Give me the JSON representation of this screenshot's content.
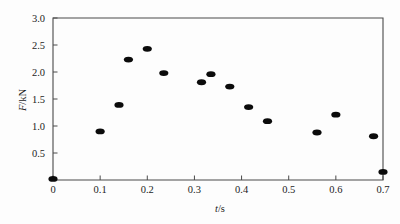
{
  "chart_data": {
    "type": "scatter",
    "title": "",
    "xlabel": "t/s",
    "ylabel": "F/kN",
    "xlabel_symbol": "t",
    "xlabel_unit": "/s",
    "ylabel_symbol": "F",
    "ylabel_unit": "/kN",
    "xlim": [
      0,
      0.7
    ],
    "ylim": [
      0,
      3.0
    ],
    "xticks": [
      0,
      0.1,
      0.2,
      0.3,
      0.4,
      0.5,
      0.6,
      0.7
    ],
    "xticklabels": [
      "0",
      "0.1",
      "0.2",
      "0.3",
      "0.4",
      "0.5",
      "0.6",
      "0.7"
    ],
    "yticks": [
      0.5,
      1.0,
      1.5,
      2.0,
      2.5,
      3.0
    ],
    "yticklabels": [
      "0.5",
      "1.0",
      "1.5",
      "2.0",
      "2.5",
      "3.0"
    ],
    "grid": false,
    "legend": null,
    "marker": "filled-ellipse",
    "marker_color": "#0b0b0b",
    "frame_color": "#4a4a4a",
    "background": "#fdfdfd",
    "x": [
      0.0,
      0.1,
      0.14,
      0.16,
      0.2,
      0.235,
      0.315,
      0.335,
      0.375,
      0.415,
      0.455,
      0.56,
      0.6,
      0.68,
      0.7
    ],
    "y": [
      0.02,
      0.9,
      1.39,
      2.23,
      2.43,
      1.98,
      1.81,
      1.96,
      1.73,
      1.35,
      1.09,
      0.88,
      1.21,
      0.81,
      0.15
    ],
    "points": [
      {
        "t": 0.0,
        "F": 0.02
      },
      {
        "t": 0.1,
        "F": 0.9
      },
      {
        "t": 0.14,
        "F": 1.39
      },
      {
        "t": 0.16,
        "F": 2.23
      },
      {
        "t": 0.2,
        "F": 2.43
      },
      {
        "t": 0.235,
        "F": 1.98
      },
      {
        "t": 0.315,
        "F": 1.81
      },
      {
        "t": 0.335,
        "F": 1.96
      },
      {
        "t": 0.375,
        "F": 1.73
      },
      {
        "t": 0.415,
        "F": 1.35
      },
      {
        "t": 0.455,
        "F": 1.09
      },
      {
        "t": 0.56,
        "F": 0.88
      },
      {
        "t": 0.6,
        "F": 1.21
      },
      {
        "t": 0.68,
        "F": 0.81
      },
      {
        "t": 0.7,
        "F": 0.15
      }
    ]
  }
}
